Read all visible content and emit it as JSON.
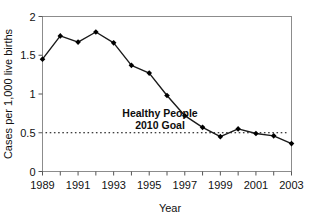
{
  "chart_data": {
    "type": "line",
    "title": "",
    "xlabel": "Year",
    "ylabel": "Cases per 1,000 live births",
    "categories": [
      1989,
      1990,
      1991,
      1992,
      1993,
      1994,
      1995,
      1996,
      1997,
      1998,
      1999,
      2000,
      2001,
      2002,
      2003
    ],
    "values": [
      1.45,
      1.75,
      1.67,
      1.8,
      1.66,
      1.37,
      1.27,
      0.98,
      0.72,
      0.57,
      0.45,
      0.55,
      0.49,
      0.46,
      0.36
    ],
    "series": [
      {
        "name": "Cases per 1,000 live births",
        "values": [
          1.45,
          1.75,
          1.67,
          1.8,
          1.66,
          1.37,
          1.27,
          0.98,
          0.72,
          0.57,
          0.45,
          0.55,
          0.49,
          0.46,
          0.36
        ]
      }
    ],
    "xlim": [
      1989,
      2003
    ],
    "ylim": [
      0,
      2
    ],
    "yticks": [
      0,
      0.5,
      1,
      1.5,
      2
    ],
    "ytick_labels": [
      "0",
      "0.5",
      "1",
      "1.5",
      "2"
    ],
    "xticks": [
      1989,
      1990,
      1991,
      1992,
      1993,
      1994,
      1995,
      1996,
      1997,
      1998,
      1999,
      2000,
      2001,
      2002,
      2003
    ],
    "xtick_labels": [
      "1989",
      "",
      "1991",
      "",
      "1993",
      "",
      "1995",
      "",
      "1997",
      "",
      "1999",
      "",
      "2001",
      "",
      "2003"
    ],
    "grid": false,
    "legend": "none",
    "marker": "filled-diamond",
    "line_color": "#1a1a1a",
    "marker_color": "#000000",
    "annotations": [
      {
        "name": "healthy-people-goal",
        "line1": "Healthy People",
        "line2": "2010 Goal",
        "value": 0.5,
        "style": "dotted-horizontal-line",
        "color": "#000000"
      }
    ]
  }
}
